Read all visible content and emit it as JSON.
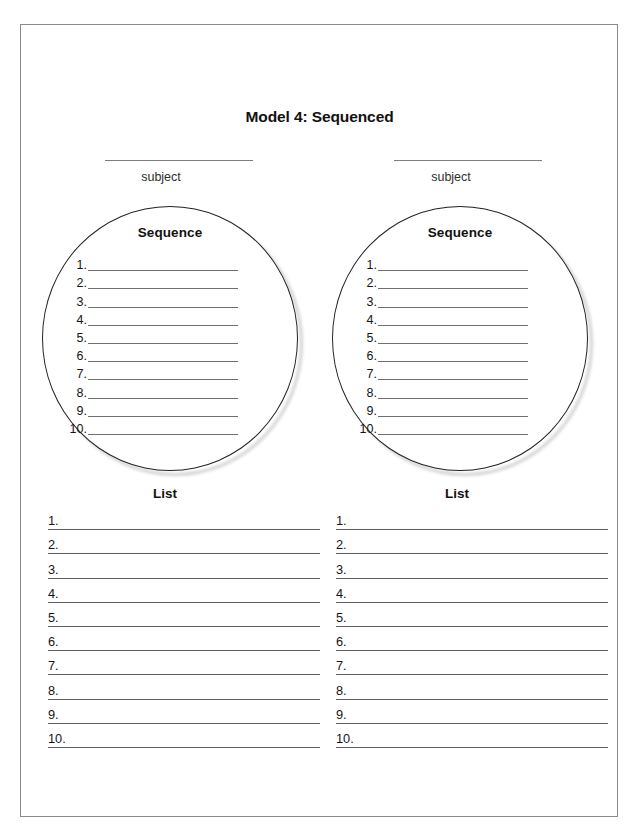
{
  "folio": "80",
  "title": "Model 4: Sequenced",
  "columns": [
    {
      "subject_label": "subject",
      "circle_heading": "Sequence",
      "sequence_numbers": [
        "1.",
        "2.",
        "3.",
        "4.",
        "5.",
        "6.",
        "7.",
        "8.",
        "9.",
        "10."
      ],
      "list_heading": "List",
      "list_numbers": [
        "1.",
        "2.",
        "3.",
        "4.",
        "5.",
        "6.",
        "7.",
        "8.",
        "9.",
        "10."
      ]
    },
    {
      "subject_label": "subject",
      "circle_heading": "Sequence",
      "sequence_numbers": [
        "1.",
        "2.",
        "3.",
        "4.",
        "5.",
        "6.",
        "7.",
        "8.",
        "9.",
        "10."
      ],
      "list_heading": "List",
      "list_numbers": [
        "1.",
        "2.",
        "3.",
        "4.",
        "5.",
        "6.",
        "7.",
        "8.",
        "9.",
        "10."
      ]
    }
  ],
  "colors": {
    "page_border": "#8a8a8a",
    "circle_stroke": "#232323",
    "rule": "#6f6f6f",
    "text": "#161616"
  }
}
